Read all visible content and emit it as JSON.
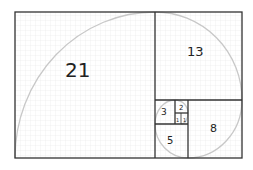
{
  "diagram": {
    "colors": {
      "grid": "#e6e6e6",
      "border": "#333333",
      "spiral": "#c8c8c8",
      "text": "#222222"
    },
    "squares": [
      {
        "label": "21",
        "x": 15,
        "y": 12,
        "w": 140,
        "h": 146
      },
      {
        "label": "13",
        "x": 155,
        "y": 12,
        "w": 87,
        "h": 88
      },
      {
        "label": "8",
        "x": 188,
        "y": 100,
        "w": 54,
        "h": 58
      },
      {
        "label": "5",
        "x": 155,
        "y": 124,
        "w": 33,
        "h": 34
      },
      {
        "label": "3",
        "x": 155,
        "y": 100,
        "w": 20,
        "h": 24
      },
      {
        "label": "2",
        "x": 175,
        "y": 100,
        "w": 13,
        "h": 13
      },
      {
        "label": "1",
        "x": 175,
        "y": 113,
        "w": 6,
        "h": 11
      },
      {
        "label": "1",
        "x": 181,
        "y": 113,
        "w": 7,
        "h": 11
      }
    ]
  }
}
